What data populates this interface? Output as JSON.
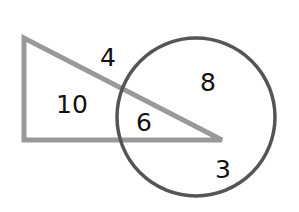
{
  "diagram": {
    "type": "venn-overlap",
    "shapes": {
      "triangle": {
        "name": "triangle",
        "points": [
          [
            24,
            38
          ],
          [
            24,
            140
          ],
          [
            222,
            140
          ]
        ],
        "stroke": "#999999",
        "stroke_width": 5
      },
      "circle": {
        "name": "circle",
        "cx": 196,
        "cy": 117,
        "r": 79,
        "stroke": "#555555",
        "stroke_width": 3.5
      }
    },
    "labels": {
      "outside_above_triangle": {
        "text": "4",
        "x": 108,
        "y": 66
      },
      "triangle_only": {
        "text": "10",
        "x": 72,
        "y": 113
      },
      "triangle_and_circle": {
        "text": "6",
        "x": 144,
        "y": 131
      },
      "circle_upper": {
        "text": "8",
        "x": 208,
        "y": 91
      },
      "circle_lower": {
        "text": "3",
        "x": 223,
        "y": 178
      }
    }
  }
}
